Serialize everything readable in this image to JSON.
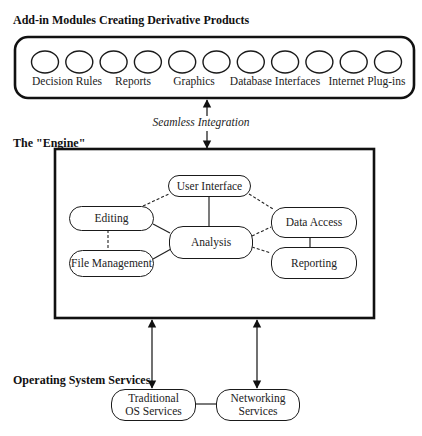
{
  "sections": {
    "modules_title": "Add-in Modules Creating Derivative Products",
    "engine_title": "The \"Engine\"",
    "os_title": "Operating System Services"
  },
  "modules": {
    "circle_count": 11,
    "labels": [
      "Decision Rules",
      "Reports",
      "Graphics",
      "Database Interfaces",
      "Internet Plug-ins"
    ]
  },
  "integration": {
    "label": "Seamless Integration"
  },
  "engine": {
    "nodes": {
      "user_interface": "User Interface",
      "editing": "Editing",
      "analysis": "Analysis",
      "file_management": "File Management",
      "data_access": "Data Access",
      "reporting": "Reporting"
    },
    "connections": [
      {
        "from": "user_interface",
        "to": "analysis",
        "style": "solid"
      },
      {
        "from": "editing",
        "to": "analysis",
        "style": "solid"
      },
      {
        "from": "file_management",
        "to": "analysis",
        "style": "solid"
      },
      {
        "from": "editing",
        "to": "user_interface",
        "style": "dashed"
      },
      {
        "from": "user_interface",
        "to": "data_access",
        "style": "dashed"
      },
      {
        "from": "analysis",
        "to": "data_access",
        "style": "dashed"
      },
      {
        "from": "analysis",
        "to": "reporting",
        "style": "dashed"
      },
      {
        "from": "editing",
        "to": "file_management",
        "style": "dashed"
      },
      {
        "from": "data_access",
        "to": "reporting",
        "style": "solid"
      }
    ]
  },
  "os_services": {
    "traditional": [
      "Traditional",
      "OS Services"
    ],
    "networking": [
      "Networking",
      "Services"
    ]
  }
}
